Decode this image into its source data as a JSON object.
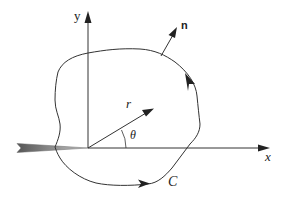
{
  "diagram": {
    "type": "crack-tip contour integral diagram",
    "labels": {
      "y_axis": "y",
      "x_axis": "x",
      "normal": "n",
      "radius": "r",
      "angle": "θ",
      "contour": "C"
    },
    "colors": {
      "line": "#333333",
      "crack_fill_dark": "#555555",
      "crack_fill_light": "#bbbbbb",
      "background": "#ffffff"
    },
    "elements": [
      "cartesian axes x and y with origin at crack tip",
      "crack wedge along negative x-axis",
      "closed counter-clockwise contour C around crack tip",
      "outward normal vector n on contour",
      "polar radius vector r at angle θ from x-axis"
    ]
  }
}
